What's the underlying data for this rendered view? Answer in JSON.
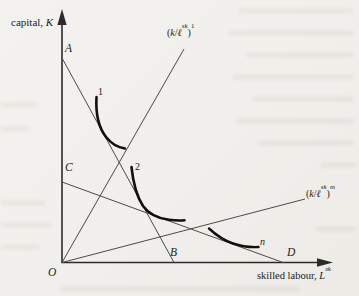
{
  "figure": {
    "background": "#f1efeb",
    "axis_color": "#2b2b2b",
    "line_color": "#4a4a4a",
    "curve_color": "#101010",
    "y_axis_label": {
      "prefix": "capital, ",
      "symbol": "K"
    },
    "x_axis_label": {
      "prefix": "skilled labour, ",
      "symbol": "L",
      "sup": "sk"
    },
    "points": {
      "origin": "O",
      "a": "A",
      "b": "B",
      "c": "C",
      "d": "D"
    },
    "curves": [
      {
        "label": "1"
      },
      {
        "label": "2"
      },
      {
        "label": "n"
      }
    ],
    "rays": {
      "steep": {
        "open": "(",
        "numerator": "k",
        "slash": "/",
        "denominator": "ℓ",
        "denominator_sup": "sk",
        "close": ")",
        "exponent": "1"
      },
      "shallow": {
        "open": "(",
        "numerator": "k",
        "slash": "/",
        "denominator": "ℓ",
        "denominator_sup": "sk",
        "close": ")",
        "exponent": "m"
      }
    }
  }
}
